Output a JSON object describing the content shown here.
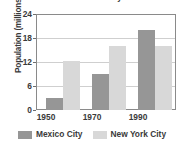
{
  "chart_data": {
    "type": "bar",
    "title": "and Mexico City",
    "subtitle": "",
    "xlabel": "",
    "ylabel": "Population (millions)",
    "categories": [
      "1950",
      "1970",
      "1990"
    ],
    "series": [
      {
        "name": "Mexico City",
        "color": "#969696",
        "values": [
          3.1,
          9.2,
          20.2
        ]
      },
      {
        "name": "New York City",
        "color": "#d8d8d8",
        "values": [
          12.3,
          16.2,
          16.2
        ]
      }
    ],
    "ylim": [
      0,
      24
    ],
    "yticks": [
      0,
      6,
      12,
      18,
      24
    ],
    "ytick_labels": [
      "0",
      "6",
      "12",
      "18",
      "24"
    ],
    "grid": true,
    "legend_position": "bottom"
  },
  "legend": {
    "items": [
      {
        "label": "Mexico City",
        "swatch": "legend-swatch-mexico-city"
      },
      {
        "label": "New York City",
        "swatch": "legend-swatch-new-york-city"
      }
    ]
  }
}
